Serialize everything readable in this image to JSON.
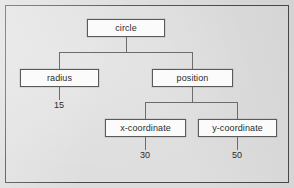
{
  "figure": {
    "type": "object-diagram",
    "background_color": "#dcdcdc",
    "frame_color": "#4a4a4a",
    "node_fill": "#fbfbfb",
    "node_border": "#5a5a5a",
    "edge_color": "#6c6c6c",
    "text_color": "#2b2b2b"
  },
  "nodes": {
    "root": {
      "label": "circle"
    },
    "radius": {
      "label": "radius"
    },
    "position": {
      "label": "position"
    },
    "x_coordinate": {
      "label": "x-coordinate"
    },
    "y_coordinate": {
      "label": "y-coordinate"
    }
  },
  "values": {
    "radius": "15",
    "x_coordinate": "30",
    "y_coordinate": "50"
  },
  "tree": {
    "name": "circle",
    "children": [
      {
        "name": "radius",
        "value": "15"
      },
      {
        "name": "position",
        "children": [
          {
            "name": "x-coordinate",
            "value": "30"
          },
          {
            "name": "y-coordinate",
            "value": "50"
          }
        ]
      }
    ]
  }
}
